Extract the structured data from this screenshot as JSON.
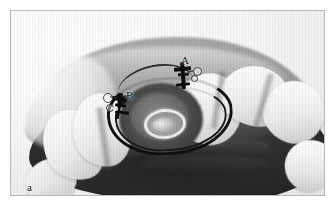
{
  "figure": {
    "panel_label": "a",
    "domain_note": "grayscale intraoral clinical photograph",
    "frame_color": "#b9b9b9",
    "background_color": "#ffffff"
  },
  "annotations": [
    {
      "id": "label-a",
      "text": "A",
      "description": "orthodontic bracket on right central incisor"
    },
    {
      "id": "label-b",
      "text": "B",
      "description": "orthodontic bracket on left lateral incisor"
    }
  ],
  "photo": {
    "view": "occlusal view of maxillary arch",
    "structures": [
      "maxillary anterior teeth",
      "gingiva",
      "hard palate",
      "edentulous implant site with healing abutment ring",
      "black orthodontic archwire loop",
      "bonded brackets"
    ],
    "tone_palette": {
      "tooth_highlight": "#ffffff",
      "tooth_shadow": "#c2c2c2",
      "gingiva": "#9c9c9c",
      "palate_dark": "#2c2c2c",
      "wire_black": "#101010",
      "abutment_ring": "#f3f3f3"
    }
  }
}
